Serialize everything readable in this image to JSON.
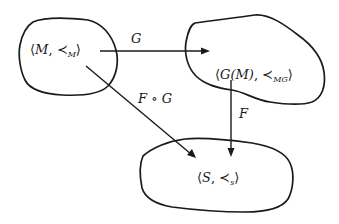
{
  "diagram": {
    "type": "commutative-diagram",
    "nodes": [
      {
        "id": "M",
        "label_main": "M",
        "order_symbol": "≺",
        "order_subscript": "M",
        "prefix": "⟨",
        "sep": ", ",
        "suffix": "⟩"
      },
      {
        "id": "GM",
        "label_main": "G(M)",
        "order_symbol": "≺",
        "order_subscript": "MG",
        "prefix": "⟨",
        "sep": ", ",
        "suffix": "⟩"
      },
      {
        "id": "S",
        "label_main": "S",
        "order_symbol": "≺",
        "order_subscript": "s",
        "prefix": "⟨",
        "sep": ", ",
        "suffix": "⟩"
      }
    ],
    "edges": [
      {
        "id": "G",
        "from": "M",
        "to": "GM",
        "label": "G"
      },
      {
        "id": "F",
        "from": "GM",
        "to": "S",
        "label": "F"
      },
      {
        "id": "FoG",
        "from": "M",
        "to": "S",
        "label": "F ∘ G"
      }
    ],
    "colors": {
      "stroke": "#1a1a1a",
      "background": "#ffffff"
    }
  }
}
